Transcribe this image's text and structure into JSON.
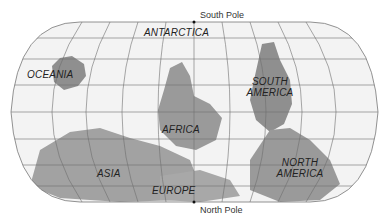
{
  "map": {
    "title": "Upside-down world map",
    "colors": {
      "ocean": "#f3f3f3",
      "land": "#9a9a9a",
      "grid": "#6e6e6e",
      "text": "#222222"
    },
    "poles": {
      "top": "South Pole",
      "bottom": "North Pole"
    },
    "labels": {
      "antarctica": "ANTARCTICA",
      "oceania": "OCEANIA",
      "south_america_1": "SOUTH",
      "south_america_2": "AMERICA",
      "africa": "AFRICA",
      "asia": "ASIA",
      "europe": "EUROPE",
      "north_america_1": "NORTH",
      "north_america_2": "AMERICA"
    }
  }
}
